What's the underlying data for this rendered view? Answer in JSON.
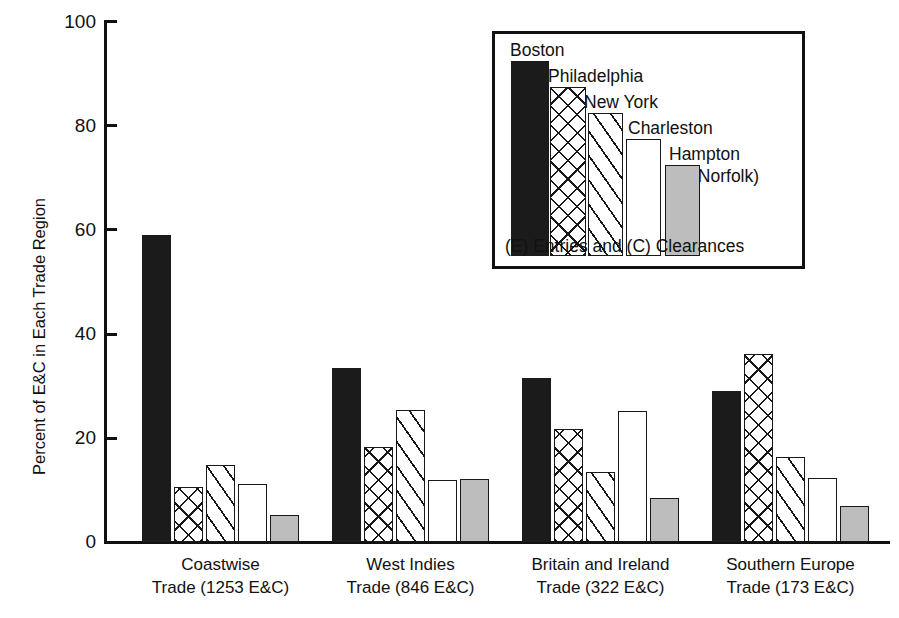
{
  "chart_data": {
    "type": "bar",
    "title": "",
    "subtitle": "",
    "xlabel": "",
    "ylabel": "Percent of E&C in Each Trade Region",
    "ylim": [
      0,
      100
    ],
    "yticks": [
      0,
      20,
      40,
      60,
      80,
      100
    ],
    "grid": false,
    "legend_position": "upper-right-inset",
    "legend_note": "(E) Entries and (C) Clearances",
    "categories": [
      "Coastwise\nTrade (1253 E&C)",
      "West Indies\nTrade (846 E&C)",
      "Britain and Ireland\nTrade (322 E&C)",
      "Southern Europe\nTrade (173 E&C)"
    ],
    "category_lines": [
      [
        "Coastwise",
        "Trade (1253 E&C)"
      ],
      [
        "West Indies",
        "Trade (846 E&C)"
      ],
      [
        "Britain and Ireland",
        "Trade (322 E&C)"
      ],
      [
        "Southern Europe",
        "Trade (173 E&C)"
      ]
    ],
    "series": [
      {
        "name": "Boston",
        "fill": "solid-black",
        "values": [
          58.8,
          33.3,
          31.5,
          29.0
        ]
      },
      {
        "name": "Philadelphia",
        "fill": "crosshatch",
        "values": [
          10.6,
          18.2,
          21.7,
          36.0
        ]
      },
      {
        "name": "New York",
        "fill": "diagonal",
        "values": [
          14.8,
          25.2,
          13.5,
          16.2
        ]
      },
      {
        "name": "Charleston",
        "fill": "white",
        "values": [
          11.1,
          11.9,
          25.1,
          12.3
        ]
      },
      {
        "name": "Hampton (Norfolk)",
        "fill": "gray",
        "values": [
          5.1,
          12.1,
          8.5,
          6.9
        ]
      }
    ],
    "legend_entries": [
      {
        "label": "Boston",
        "label2": ""
      },
      {
        "label": "Philadelphia",
        "label2": ""
      },
      {
        "label": "New York",
        "label2": ""
      },
      {
        "label": "Charleston",
        "label2": ""
      },
      {
        "label": "Hampton",
        "label2": "(Norfolk)"
      }
    ],
    "colors": {
      "boston": "#1b1b1b",
      "philadelphia": "#ffffff",
      "new_york": "#ffffff",
      "charleston": "#ffffff",
      "hampton": "#bdbdbd",
      "axis": "#111111",
      "background": "#ffffff"
    }
  },
  "axis": {
    "ytick_labels": [
      "100",
      "80",
      "60",
      "40",
      "20",
      "0"
    ],
    "ylabel": "Percent of E&C in Each Trade Region"
  },
  "legend": {
    "note": "(E) Entries and (C) Clearances",
    "items": [
      "Boston",
      "Philadelphia",
      "New York",
      "Charleston",
      "Hampton",
      "(Norfolk)"
    ]
  }
}
